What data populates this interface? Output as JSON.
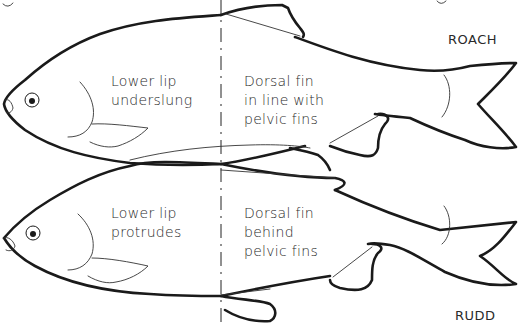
{
  "diagram": {
    "colors": {
      "ink": "#1a1a1a",
      "background": "#ffffff"
    },
    "fish": [
      {
        "name": "ROACH",
        "head_note": [
          "Lower lip",
          "underslung"
        ],
        "fin_note": [
          "Dorsal fin",
          "in line with",
          "pelvic fins"
        ]
      },
      {
        "name": "RUDD",
        "head_note": [
          "Lower lip",
          "protrudes"
        ],
        "fin_note": [
          "Dorsal fin",
          "behind",
          "pelvic fins"
        ]
      }
    ],
    "divider": "dashed vertical reference line at dorsal fin position"
  }
}
